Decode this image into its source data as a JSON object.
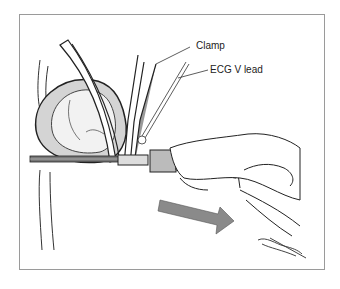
{
  "figure": {
    "labels": {
      "clamp": "Clamp",
      "ecg_lead": "ECG V lead"
    },
    "arrow": {
      "direction": "right",
      "color": "#8a8a8a"
    },
    "signature": "artist-signature"
  }
}
